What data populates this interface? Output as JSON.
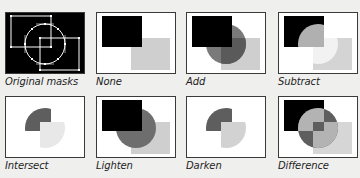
{
  "panels": [
    {
      "id": "original",
      "label": "Original masks"
    },
    {
      "id": "none",
      "label": "None"
    },
    {
      "id": "add",
      "label": "Add"
    },
    {
      "id": "subtract",
      "label": "Subtract"
    },
    {
      "id": "intersect",
      "label": "Intersect"
    },
    {
      "id": "lighten",
      "label": "Lighten"
    },
    {
      "id": "darken",
      "label": "Darken"
    },
    {
      "id": "difference",
      "label": "Difference"
    }
  ],
  "colors": {
    "background": "#efefee",
    "frame_border": "#3a3a3a",
    "black_mask": "#000000",
    "circle_mask": "#7a7a7a",
    "light_mask": "#cfcfcf",
    "overlap_dark": "#5a5a5a",
    "light_circle": "#b4b4b4",
    "faint": "#e6e6e6"
  }
}
